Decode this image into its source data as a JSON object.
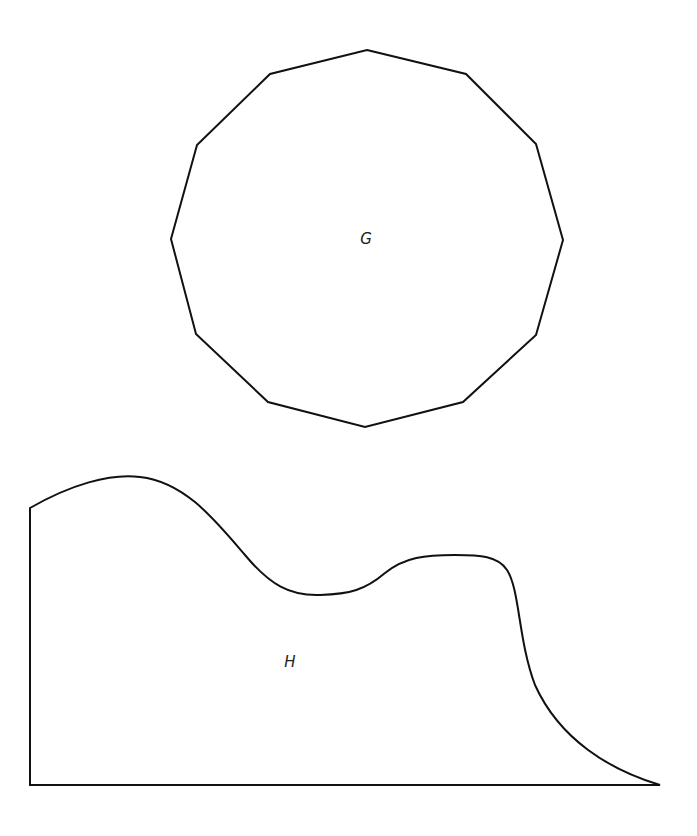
{
  "shapes": [
    {
      "id": "G",
      "label": "G",
      "type": "dodecagon",
      "points": "367,50 466,74 536,144 563,240 536,335 463,402 365,427 268,402 196,334 171,239 197,145 270,74",
      "label_pos": [
        366,
        244
      ]
    },
    {
      "id": "H",
      "label": "H",
      "type": "curved-region",
      "path": "M30,508 C70,485 110,473 140,477 C185,482 215,520 245,555 C270,585 290,596 320,595 C350,594 365,590 385,573 C405,557 425,555 455,555 C480,555 498,556 507,570 C520,590 518,640 535,685 C560,740 610,770 660,785 L30,785 Z",
      "label_pos": [
        290,
        667
      ]
    }
  ],
  "style": {
    "stroke": "#111111",
    "fill": "none",
    "stroke_width": 2
  }
}
